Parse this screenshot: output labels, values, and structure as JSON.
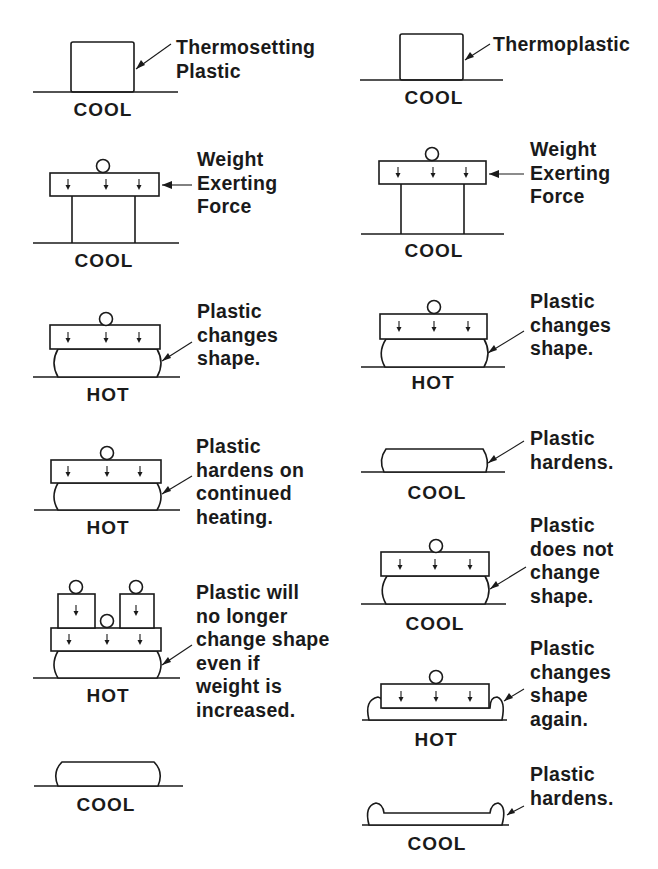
{
  "diagram": {
    "columns": [
      {
        "name": "thermosetting",
        "steps": [
          {
            "state": "COOL",
            "note": "Thermosetting\nPlastic"
          },
          {
            "state": "COOL",
            "note": "Weight\nExerting\nForce"
          },
          {
            "state": "HOT",
            "note": "Plastic\nchanges\nshape."
          },
          {
            "state": "HOT",
            "note": "Plastic\nhardens on\ncontinued\nheating."
          },
          {
            "state": "HOT",
            "note": "Plastic will\nno longer\nchange shape\neven if\nweight is\nincreased."
          },
          {
            "state": "COOL",
            "note": ""
          }
        ]
      },
      {
        "name": "thermoplastic",
        "steps": [
          {
            "state": "COOL",
            "note": "Thermoplastic"
          },
          {
            "state": "COOL",
            "note": "Weight\nExerting\nForce"
          },
          {
            "state": "HOT",
            "note": "Plastic\nchanges\nshape."
          },
          {
            "state": "COOL",
            "note": "Plastic\nhardens."
          },
          {
            "state": "COOL",
            "note": "Plastic\ndoes not\nchange\nshape."
          },
          {
            "state": "HOT",
            "note": "Plastic\nchanges\nshape\nagain."
          },
          {
            "state": "COOL",
            "note": "Plastic\nhardens."
          }
        ]
      }
    ],
    "colors": {
      "ink": "#1a1a1a",
      "background": "#ffffff"
    }
  }
}
